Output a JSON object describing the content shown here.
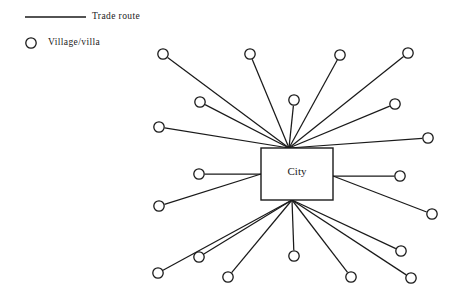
{
  "figure": {
    "background_color": "#ffffff",
    "stroke_color": "#1a1a1a",
    "node_fill_color": "#ffffff"
  },
  "legend": {
    "items": [
      {
        "key": "trade-route",
        "symbol": "line",
        "label": "Trade route"
      },
      {
        "key": "village-villa",
        "symbol": "circle",
        "label": "Village/villa"
      }
    ],
    "route_label": "Trade route",
    "village_label": "Village/villa",
    "line": {
      "x1": 25,
      "y1": 17,
      "x2": 86,
      "y2": 17,
      "width": 1.6
    },
    "circle": {
      "cx": 31,
      "cy": 43,
      "r": 5.2
    }
  },
  "hub": {
    "label": "City",
    "box": {
      "x": 261,
      "y": 148,
      "width": 72,
      "height": 52
    },
    "connection_points": {
      "top": {
        "x": 289,
        "y": 148
      },
      "bottom": {
        "x": 292,
        "y": 200
      },
      "left": {
        "x": 261,
        "y": 174
      },
      "right": {
        "x": 333,
        "y": 176
      }
    }
  },
  "nodes": [
    {
      "id": "v1",
      "label": "Village/villa",
      "cx": 163,
      "cy": 54,
      "r": 5.2,
      "anchor": "top"
    },
    {
      "id": "v2",
      "label": "Village/villa",
      "cx": 250,
      "cy": 54,
      "r": 5.2,
      "anchor": "top"
    },
    {
      "id": "v3",
      "label": "Village/villa",
      "cx": 340,
      "cy": 55,
      "r": 5.2,
      "anchor": "top"
    },
    {
      "id": "v4",
      "label": "Village/villa",
      "cx": 408,
      "cy": 53,
      "r": 5.2,
      "anchor": "top"
    },
    {
      "id": "v5",
      "label": "Village/villa",
      "cx": 200,
      "cy": 102,
      "r": 5.2,
      "anchor": "top"
    },
    {
      "id": "v6",
      "label": "Village/villa",
      "cx": 294,
      "cy": 100,
      "r": 5.2,
      "anchor": "top"
    },
    {
      "id": "v7",
      "label": "Village/villa",
      "cx": 395,
      "cy": 104,
      "r": 5.2,
      "anchor": "top"
    },
    {
      "id": "v8",
      "label": "Village/villa",
      "cx": 159,
      "cy": 127,
      "r": 5.2,
      "anchor": "top"
    },
    {
      "id": "v9",
      "label": "Village/villa",
      "cx": 428,
      "cy": 138,
      "r": 5.2,
      "anchor": "top"
    },
    {
      "id": "v10",
      "label": "Village/villa",
      "cx": 199,
      "cy": 174,
      "r": 5.2,
      "anchor": "left"
    },
    {
      "id": "v11",
      "label": "Village/villa",
      "cx": 400,
      "cy": 176,
      "r": 5.2,
      "anchor": "right"
    },
    {
      "id": "v12",
      "label": "Village/villa",
      "cx": 159,
      "cy": 206,
      "r": 5.2,
      "anchor": "left"
    },
    {
      "id": "v13",
      "label": "Village/villa",
      "cx": 432,
      "cy": 214,
      "r": 5.2,
      "anchor": "right"
    },
    {
      "id": "v14",
      "label": "Village/villa",
      "cx": 158,
      "cy": 273,
      "r": 5.2,
      "anchor": "bottom"
    },
    {
      "id": "v15",
      "label": "Village/villa",
      "cx": 199,
      "cy": 257,
      "r": 5.2,
      "anchor": "bottom"
    },
    {
      "id": "v16",
      "label": "Village/villa",
      "cx": 228,
      "cy": 277,
      "r": 5.2,
      "anchor": "bottom"
    },
    {
      "id": "v17",
      "label": "Village/villa",
      "cx": 294,
      "cy": 256,
      "r": 5.2,
      "anchor": "bottom"
    },
    {
      "id": "v18",
      "label": "Village/villa",
      "cx": 351,
      "cy": 277,
      "r": 5.2,
      "anchor": "bottom"
    },
    {
      "id": "v19",
      "label": "Village/villa",
      "cx": 401,
      "cy": 251,
      "r": 5.2,
      "anchor": "bottom"
    },
    {
      "id": "v20",
      "label": "Village/villa",
      "cx": 411,
      "cy": 278,
      "r": 5.2,
      "anchor": "bottom"
    }
  ],
  "edges": [
    {
      "from": "v1",
      "to": "hub-top"
    },
    {
      "from": "v2",
      "to": "hub-top"
    },
    {
      "from": "v3",
      "to": "hub-top"
    },
    {
      "from": "v4",
      "to": "hub-top"
    },
    {
      "from": "v5",
      "to": "hub-top"
    },
    {
      "from": "v6",
      "to": "hub-top"
    },
    {
      "from": "v7",
      "to": "hub-top"
    },
    {
      "from": "v8",
      "to": "hub-top"
    },
    {
      "from": "v9",
      "to": "hub-top"
    },
    {
      "from": "v10",
      "to": "hub-left"
    },
    {
      "from": "v12",
      "to": "hub-left"
    },
    {
      "from": "v11",
      "to": "hub-right"
    },
    {
      "from": "v13",
      "to": "hub-right"
    },
    {
      "from": "v14",
      "to": "hub-bottom"
    },
    {
      "from": "v15",
      "to": "hub-bottom"
    },
    {
      "from": "v16",
      "to": "hub-bottom"
    },
    {
      "from": "v17",
      "to": "hub-bottom"
    },
    {
      "from": "v18",
      "to": "hub-bottom"
    },
    {
      "from": "v19",
      "to": "hub-bottom"
    },
    {
      "from": "v20",
      "to": "hub-bottom"
    }
  ]
}
